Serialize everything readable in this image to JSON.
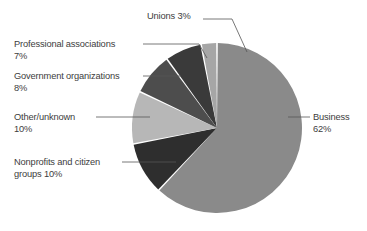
{
  "chart_data": {
    "type": "pie",
    "title": "",
    "subtitle": "",
    "xlabel": "",
    "ylabel": "",
    "legend_position": "callout-labels",
    "grid": false,
    "total": 100,
    "unit": "%",
    "categories": [
      "Business",
      "Nonprofits and citizen groups",
      "Other/unknown",
      "Government organizations",
      "Professional associations",
      "Unions"
    ],
    "values": [
      62,
      10,
      10,
      8,
      7,
      3
    ],
    "slices": [
      {
        "name": "Business",
        "value": 62,
        "value_label": "62%",
        "color": "#8a8a8a",
        "start_angle_deg": 0,
        "end_angle_deg": 223.2,
        "label_line1": "Business",
        "label_line2": "62%",
        "label_position": "right"
      },
      {
        "name": "Nonprofits and citizen groups",
        "value": 10,
        "value_label": "10%",
        "color": "#2e2e2e",
        "start_angle_deg": 223.2,
        "end_angle_deg": 259.2,
        "label_line1": "Nonprofits and citizen",
        "label_line2": "groups  10%",
        "label_position": "left"
      },
      {
        "name": "Other/unknown",
        "value": 10,
        "value_label": "10%",
        "color": "#b7b7b7",
        "start_angle_deg": 259.2,
        "end_angle_deg": 295.2,
        "label_line1": "Other/unknown",
        "label_line2": "10%",
        "label_position": "left"
      },
      {
        "name": "Government organizations",
        "value": 8,
        "value_label": "8%",
        "color": "#4d4d4d",
        "start_angle_deg": 295.2,
        "end_angle_deg": 324.0,
        "label_line1": "Government organizations",
        "label_line2": "8%",
        "label_position": "left"
      },
      {
        "name": "Professional associations",
        "value": 7,
        "value_label": "7%",
        "color": "#3a3a3a",
        "start_angle_deg": 324.0,
        "end_angle_deg": 349.2,
        "label_line1": "Professional associations",
        "label_line2": "7%",
        "label_position": "left"
      },
      {
        "name": "Unions",
        "value": 3,
        "value_label": "3%",
        "color": "#a6a6a6",
        "start_angle_deg": 349.2,
        "end_angle_deg": 360.0,
        "label_line1": "Unions  3%",
        "label_line2": "",
        "label_position": "top"
      }
    ],
    "geometry": {
      "center_x": 217,
      "center_y": 128,
      "radius": 85,
      "gap_color": "#ffffff",
      "background": "#ffffff"
    }
  },
  "labels": {
    "unions": {
      "line1": "Unions  3%",
      "line2": ""
    },
    "professional_associations": {
      "line1": "Professional associations",
      "line2": "7%"
    },
    "government_organizations": {
      "line1": "Government organizations",
      "line2": "8%"
    },
    "other_unknown": {
      "line1": "Other/unknown",
      "line2": "10%"
    },
    "nonprofits": {
      "line1": "Nonprofits and citizen",
      "line2": "groups  10%"
    },
    "business": {
      "line1": "Business",
      "line2": "62%"
    }
  }
}
